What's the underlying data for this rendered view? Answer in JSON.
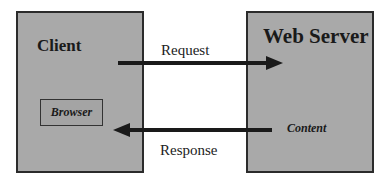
{
  "client": {
    "title": "Client",
    "component": "Browser"
  },
  "server": {
    "title": "Web Server",
    "component": "Content"
  },
  "request": {
    "label": "Request",
    "direction": "client-to-server"
  },
  "response": {
    "label": "Response",
    "direction": "server-to-client"
  },
  "colors": {
    "box_fill": "#a9a9a9",
    "border": "#2b2b2b",
    "arrow": "#1a1a1a"
  }
}
